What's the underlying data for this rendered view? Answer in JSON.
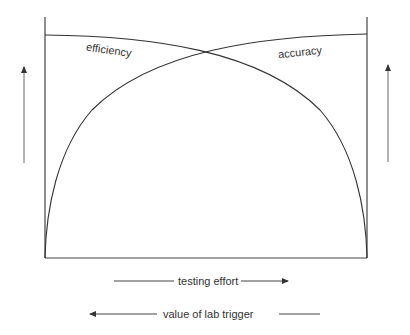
{
  "diagram": {
    "type": "conceptual-tradeoff",
    "curves": [
      {
        "name": "efficiency",
        "label": "efficiency",
        "direction": "decreasing with testing effort"
      },
      {
        "name": "accuracy",
        "label": "accuracy",
        "direction": "increasing with testing effort"
      }
    ],
    "axes": {
      "x_forward_label": "testing effort",
      "x_reverse_label": "value of lab trigger"
    },
    "colors": {
      "stroke": "#333333",
      "arrow": "#555555",
      "background": "#ffffff"
    }
  }
}
